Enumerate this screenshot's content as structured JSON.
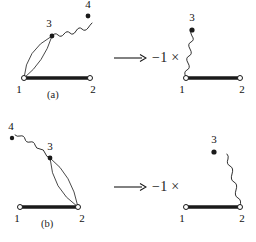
{
  "figure": {
    "type": "diagram",
    "background_color": "#ffffff",
    "ink_color": "#1a1a1a",
    "rows": [
      {
        "id": "row-a",
        "caption": "(a)",
        "relation": {
          "arrow": "→",
          "arrow_name": "rightwards-arrow",
          "factor": "−1 ×"
        },
        "left_diagram": {
          "name": "diagram-a-left",
          "vertices": [
            {
              "label": "1",
              "style": "open-circle",
              "x": 24,
              "y": 78
            },
            {
              "label": "2",
              "style": "open-circle",
              "x": 90,
              "y": 78
            },
            {
              "label": "3",
              "style": "filled-dot",
              "x": 52,
              "y": 36
            },
            {
              "label": "4",
              "style": "filled-dot",
              "x": 88,
              "y": 16
            }
          ],
          "edges": [
            {
              "kind": "thick-bar",
              "from": "1",
              "to": "2"
            },
            {
              "kind": "arc",
              "from": "1",
              "to": "3",
              "bow": "left"
            },
            {
              "kind": "arc",
              "from": "1",
              "to": "3",
              "bow": "right"
            },
            {
              "kind": "wavy",
              "from": "3",
              "to": "4"
            }
          ]
        },
        "right_diagram": {
          "name": "diagram-a-right",
          "vertices": [
            {
              "label": "1",
              "style": "open-circle",
              "x": 186,
              "y": 78
            },
            {
              "label": "2",
              "style": "open-circle",
              "x": 240,
              "y": 78
            },
            {
              "label": "3",
              "style": "filled-dot",
              "x": 212,
              "y": 30
            }
          ],
          "edges": [
            {
              "kind": "thick-bar",
              "from": "1",
              "to": "2"
            },
            {
              "kind": "wavy",
              "from": "1",
              "to": "3"
            }
          ]
        }
      },
      {
        "id": "row-b",
        "caption": "(b)",
        "relation": {
          "arrow": "→",
          "arrow_name": "rightwards-arrow",
          "factor": "−1 ×"
        },
        "left_diagram": {
          "name": "diagram-b-left",
          "vertices": [
            {
              "label": "1",
              "style": "open-circle",
              "x": 20,
              "y": 86
            },
            {
              "label": "2",
              "style": "open-circle",
              "x": 78,
              "y": 86
            },
            {
              "label": "3",
              "style": "filled-dot",
              "x": 50,
              "y": 37
            },
            {
              "label": "4",
              "style": "filled-dot",
              "x": 12,
              "y": 17
            }
          ],
          "edges": [
            {
              "kind": "thick-bar",
              "from": "1",
              "to": "2"
            },
            {
              "kind": "arc",
              "from": "3",
              "to": "2",
              "bow": "left"
            },
            {
              "kind": "arc",
              "from": "3",
              "to": "2",
              "bow": "right"
            },
            {
              "kind": "wavy",
              "from": "3",
              "to": "4"
            }
          ]
        },
        "right_diagram": {
          "name": "diagram-b-right",
          "vertices": [
            {
              "label": "1",
              "style": "open-circle",
              "x": 186,
              "y": 86
            },
            {
              "label": "2",
              "style": "open-circle",
              "x": 240,
              "y": 86
            },
            {
              "label": "3",
              "style": "filled-dot",
              "x": 214,
              "y": 30
            }
          ],
          "edges": [
            {
              "kind": "thick-bar",
              "from": "1",
              "to": "2"
            },
            {
              "kind": "wavy",
              "from": "2",
              "to": "3"
            }
          ]
        }
      }
    ]
  },
  "labels": {
    "a": {
      "caption": "(a)",
      "left": {
        "v1": "1",
        "v2": "2",
        "v3": "3",
        "v4": "4"
      },
      "right": {
        "v1": "1",
        "v2": "2",
        "v3": "3"
      },
      "arrow": "→",
      "factor": "−1 ×"
    },
    "b": {
      "caption": "(b)",
      "left": {
        "v1": "1",
        "v2": "2",
        "v3": "3",
        "v4": "4"
      },
      "right": {
        "v1": "1",
        "v2": "2",
        "v3": "3"
      },
      "arrow": "→",
      "factor": "−1 ×"
    }
  }
}
